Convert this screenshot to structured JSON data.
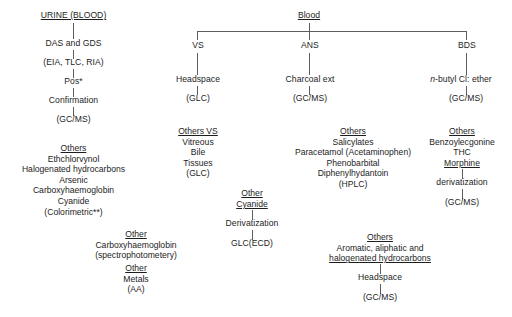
{
  "diagram": {
    "line_color": "#5d5d5d",
    "text_color": "#1d1d1d"
  },
  "urine_branch": {
    "root": "URINE (BLOOD)",
    "step1": "DAS and GDS",
    "step2": "(EIA, TLC, RIA)",
    "step3": "Pos*",
    "step4": "Confirmation",
    "step5": "(GC/MS)",
    "others_heading": "Others",
    "others_items": [
      "Ethchlorvynol",
      "Halogenated hydrocarbons",
      "Arsenic",
      "Carboxyhaemoglobin",
      "Cyanide",
      "(Colorimetric**)"
    ]
  },
  "blood_branch": {
    "root": "Blood",
    "columns": [
      {
        "label": "VS",
        "step1": "Headspace",
        "step2": "(GLC)"
      },
      {
        "label": "ANS",
        "step1": "Charcoal ext",
        "step2": "(GC/MS)"
      },
      {
        "label": "BDS",
        "step1_prefix": "n",
        "step1_rest": "-butyl Cl: ether",
        "step2": "(GC/MS)"
      }
    ]
  },
  "others_vs": {
    "heading": "Others VS",
    "items": [
      "Vitreous",
      "Bile",
      "Tissues",
      "(GLC)"
    ]
  },
  "others_ans": {
    "heading": "Others",
    "items": [
      "Salicylates",
      "Paracetamol (Acetaminophen)",
      "Phenobarbital",
      "Diphenylhydantoin",
      "(HPLC)"
    ]
  },
  "others_bds": {
    "heading": "Others",
    "item1": "Benzoylecgonine",
    "item2": "THC",
    "item3": "Morphine",
    "step1": "derivatization",
    "step2": "(GC/MS)"
  },
  "other_cyanide": {
    "heading1": "Other",
    "heading2": "Cyanide",
    "step1": "Derivatization",
    "step2": "GLC(ECD)"
  },
  "other_carboxy": {
    "heading": "Other",
    "item1": "Carboxyhaemoglobin",
    "item2": "(spectrophotometery)"
  },
  "other_metals": {
    "heading": "Other",
    "item1": "Metals",
    "item2": "(AA)"
  },
  "others_hydrocarbons": {
    "heading": "Others",
    "item1": "Aromatic, aliphatic and",
    "item2": "halogenated hydrocarbons",
    "step1": "Headspace",
    "step2": "(GC/MS)"
  }
}
